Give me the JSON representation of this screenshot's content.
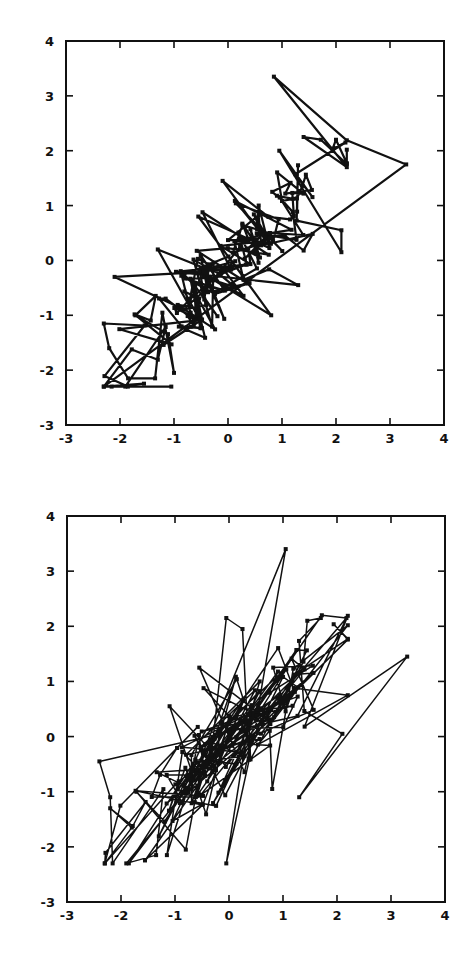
{
  "chart_data": [
    {
      "type": "line",
      "title": "",
      "xlabel": "",
      "ylabel": "",
      "xlim": [
        -3,
        4
      ],
      "ylim": [
        -3,
        4
      ],
      "x_ticks": [
        "-3",
        "-2",
        "-1",
        "0",
        "1",
        "2",
        "3",
        "4"
      ],
      "y_ticks": [
        "-3",
        "-2",
        "-1",
        "0",
        "1",
        "2",
        "3",
        "4"
      ],
      "grid": false,
      "legend": null,
      "markers": "small filled squares",
      "line_width": 2.2,
      "description": "Closed tour through ~200 correlated 2D points (positive correlation, roughly along y = x); thick lines",
      "frame_px": {
        "left": 66,
        "top": 41,
        "right": 444,
        "bottom": 425
      },
      "seed": 7,
      "notable_points": [
        [
          0.85,
          3.35
        ],
        [
          3.3,
          1.75
        ],
        [
          2.1,
          0.15
        ],
        [
          2.1,
          0.55
        ],
        [
          2.2,
          1.7
        ],
        [
          2.0,
          2.2
        ],
        [
          1.4,
          2.25
        ],
        [
          0.95,
          2.0
        ],
        [
          -0.1,
          1.45
        ],
        [
          -2.3,
          -1.15
        ],
        [
          -2.1,
          -0.3
        ],
        [
          -2.2,
          -1.6
        ],
        [
          -1.85,
          -2.15
        ],
        [
          -1.05,
          -2.3
        ],
        [
          -1.35,
          -2.15
        ],
        [
          -1.0,
          -2.05
        ],
        [
          -1.3,
          0.2
        ],
        [
          -0.55,
          0.8
        ],
        [
          1.3,
          -0.45
        ],
        [
          0.8,
          -1.0
        ]
      ]
    },
    {
      "type": "line",
      "title": "",
      "xlabel": "",
      "ylabel": "",
      "xlim": [
        -3,
        4
      ],
      "ylim": [
        -3,
        4
      ],
      "x_ticks": [
        "-3",
        "-2",
        "-1",
        "0",
        "1",
        "2",
        "3",
        "4"
      ],
      "y_ticks": [
        "-3",
        "-2",
        "-1",
        "0",
        "1",
        "2",
        "3",
        "4"
      ],
      "grid": false,
      "legend": null,
      "markers": "small filled squares",
      "line_width": 1.5,
      "description": "Same point set connected in a different (shuffled) tour order; thinner lines",
      "frame_px": {
        "left": 67,
        "top": 516,
        "right": 445,
        "bottom": 902
      },
      "seed": 23,
      "notable_points": [
        [
          1.05,
          3.4
        ],
        [
          3.3,
          1.45
        ],
        [
          -0.05,
          2.15
        ],
        [
          0.25,
          1.95
        ],
        [
          1.7,
          2.15
        ],
        [
          1.45,
          2.1
        ],
        [
          2.2,
          0.75
        ],
        [
          2.1,
          0.05
        ],
        [
          1.3,
          -1.1
        ],
        [
          -0.05,
          -2.3
        ],
        [
          -2.4,
          -0.45
        ],
        [
          -2.2,
          -1.3
        ],
        [
          -2.2,
          -1.1
        ],
        [
          -1.8,
          -1.65
        ],
        [
          -1.35,
          -2.15
        ],
        [
          -1.15,
          -2.15
        ],
        [
          -0.8,
          -2.05
        ],
        [
          -0.55,
          1.25
        ],
        [
          -1.1,
          0.55
        ],
        [
          0.8,
          -0.95
        ]
      ]
    }
  ]
}
